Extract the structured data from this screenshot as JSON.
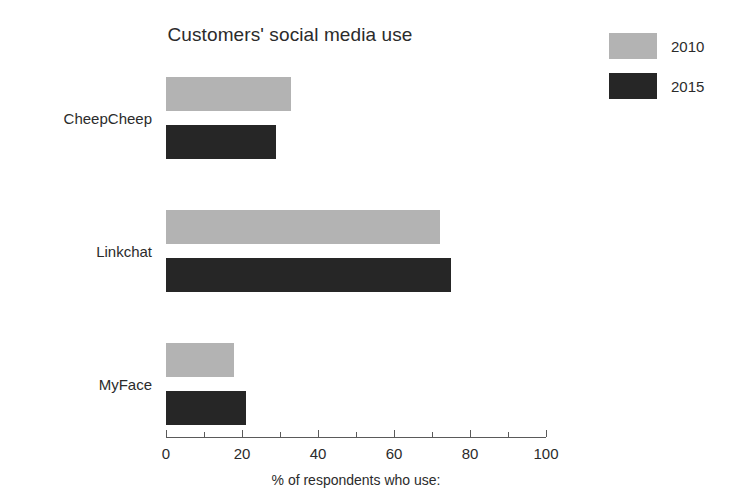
{
  "chart_data": {
    "type": "bar",
    "orientation": "horizontal",
    "title": "Customers' social media use",
    "xlabel": "% of respondents who use:",
    "ylabel": "",
    "categories": [
      "CheepCheep",
      "Linkchat",
      "MyFace"
    ],
    "series": [
      {
        "name": "2010",
        "color": "#b3b3b3",
        "values": [
          33,
          72,
          18
        ]
      },
      {
        "name": "2015",
        "color": "#262626",
        "values": [
          29,
          75,
          21
        ]
      }
    ],
    "xlim": [
      0,
      100
    ],
    "xticks": [
      0,
      20,
      40,
      60,
      80,
      100
    ],
    "xticklabels": [
      "0",
      "20",
      "40",
      "60",
      "80",
      "100"
    ],
    "minor_tick_step": 10,
    "grid": false,
    "legend_position": "top-right"
  },
  "legend": {
    "entries": [
      {
        "label": "2010",
        "color": "#b3b3b3"
      },
      {
        "label": "2015",
        "color": "#262626"
      }
    ]
  },
  "axis": {
    "title": "% of respondents who use:",
    "tick_labels": [
      "0",
      "20",
      "40",
      "60",
      "80",
      "100"
    ]
  },
  "colors": {
    "series_2010": "#b3b3b3",
    "series_2015": "#262626",
    "axis": "#5a5a5a",
    "text": "#2b2b2b",
    "background": "#ffffff"
  }
}
